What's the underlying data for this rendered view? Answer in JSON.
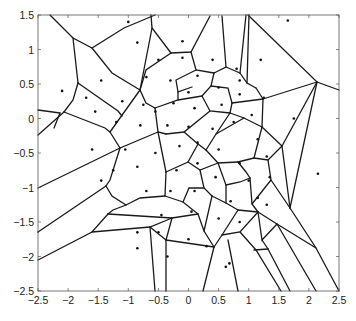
{
  "figure": {
    "type": "voronoi-diagram",
    "axes": {
      "xlim": [
        -2.5,
        2.5
      ],
      "ylim": [
        -2.5,
        1.5
      ],
      "xticks": [
        "-2.5",
        "-2",
        "-1.5",
        "-1",
        "-0.5",
        "0",
        "0.5",
        "1",
        "1.5",
        "2",
        "2.5"
      ],
      "yticks": [
        "1.5",
        "1",
        "0.5",
        "0",
        "-0.5",
        "-1",
        "-1.5",
        "-2",
        "-2.5"
      ]
    },
    "line_color": "#1a1a1a",
    "point_color": "#111111",
    "points": [
      [
        -1.0,
        1.4
      ],
      [
        1.65,
        1.42
      ],
      [
        -0.85,
        1.1
      ],
      [
        -0.1,
        1.12
      ],
      [
        -1.45,
        0.55
      ],
      [
        -2.1,
        0.4
      ],
      [
        -0.5,
        0.85
      ],
      [
        -0.1,
        0.88
      ],
      [
        0.4,
        0.85
      ],
      [
        0.8,
        0.72
      ],
      [
        1.2,
        0.85
      ],
      [
        -0.7,
        0.6
      ],
      [
        -0.3,
        0.55
      ],
      [
        0.0,
        0.38
      ],
      [
        0.5,
        0.45
      ],
      [
        0.85,
        0.55
      ],
      [
        0.85,
        0.35
      ],
      [
        0.15,
        0.62
      ],
      [
        1.25,
        0.3
      ],
      [
        -1.7,
        0.3
      ],
      [
        -1.55,
        0.1
      ],
      [
        -1.1,
        0.25
      ],
      [
        -0.75,
        0.2
      ],
      [
        -0.55,
        0.1
      ],
      [
        -0.25,
        0.22
      ],
      [
        0.1,
        0.15
      ],
      [
        0.55,
        0.2
      ],
      [
        1.05,
        0.05
      ],
      [
        -1.2,
        -0.05
      ],
      [
        -0.8,
        -0.1
      ],
      [
        -0.35,
        -0.1
      ],
      [
        0.0,
        -0.12
      ],
      [
        0.4,
        -0.15
      ],
      [
        0.75,
        -0.05
      ],
      [
        1.15,
        -0.3
      ],
      [
        1.75,
        0.0
      ],
      [
        -1.6,
        -0.45
      ],
      [
        -1.05,
        -0.45
      ],
      [
        -0.55,
        -0.5
      ],
      [
        -0.15,
        -0.4
      ],
      [
        0.15,
        -0.35
      ],
      [
        0.5,
        -0.45
      ],
      [
        0.85,
        -0.65
      ],
      [
        1.3,
        -0.55
      ],
      [
        -1.25,
        -0.75
      ],
      [
        -0.85,
        -0.7
      ],
      [
        -0.2,
        -0.75
      ],
      [
        0.15,
        -0.65
      ],
      [
        0.45,
        -0.85
      ],
      [
        1.0,
        -0.9
      ],
      [
        1.35,
        -0.85
      ],
      [
        2.15,
        -0.8
      ],
      [
        -1.45,
        -0.9
      ],
      [
        -0.7,
        -1.05
      ],
      [
        -0.3,
        -1.05
      ],
      [
        0.1,
        -1.05
      ],
      [
        0.7,
        -1.2
      ],
      [
        1.15,
        -1.15
      ],
      [
        -0.45,
        -1.4
      ],
      [
        0.05,
        -1.35
      ],
      [
        0.5,
        -1.45
      ],
      [
        0.85,
        -1.5
      ],
      [
        1.3,
        -1.25
      ],
      [
        -0.5,
        -1.65
      ],
      [
        0.0,
        -1.75
      ],
      [
        0.3,
        -1.85
      ],
      [
        -0.85,
        -1.65
      ],
      [
        -0.85,
        -1.88
      ],
      [
        -0.35,
        -2.0
      ],
      [
        0.68,
        -2.1
      ],
      [
        0.62,
        -2.15
      ]
    ]
  },
  "caption": {
    "text": ""
  }
}
